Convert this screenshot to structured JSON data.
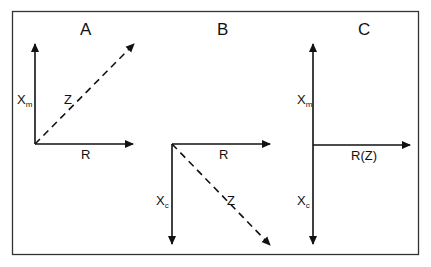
{
  "diagram": {
    "type": "impedance vector diagrams",
    "colors": {
      "stroke": "#111111",
      "background": "#ffffff",
      "frame": "#333333"
    },
    "panels": [
      {
        "title": "A",
        "axes": {
          "vertical_up": {
            "label": "X",
            "subscript": "m"
          },
          "horizontal": {
            "label": "R"
          },
          "vector": {
            "label": "Z",
            "style": "dashed",
            "direction": "up-right"
          }
        }
      },
      {
        "title": "B",
        "axes": {
          "vertical_down": {
            "label": "X",
            "subscript": "c"
          },
          "horizontal": {
            "label": "R"
          },
          "vector": {
            "label": "Z",
            "style": "dashed",
            "direction": "down-right"
          }
        }
      },
      {
        "title": "C",
        "axes": {
          "vertical_up": {
            "label": "X",
            "subscript": "m"
          },
          "vertical_down": {
            "label": "X",
            "subscript": "c"
          },
          "horizontal": {
            "label": "R(Z)"
          }
        }
      }
    ]
  }
}
